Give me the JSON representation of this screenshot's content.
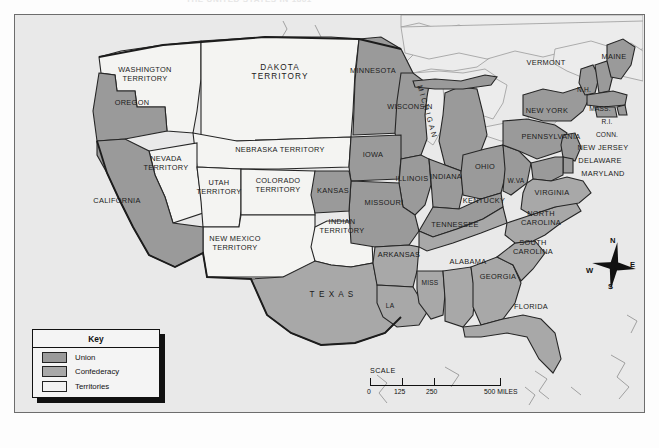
{
  "document": {
    "cut_off_heading": "THE UNITED STATES IN 1861",
    "map_title": "The United States During the Civil War"
  },
  "legend": {
    "title": "Key",
    "items": [
      {
        "label": "Union",
        "color": "#9a9a9a"
      },
      {
        "label": "Confederacy",
        "color": "#a8a8a8"
      },
      {
        "label": "Territories",
        "color": "#f2f2f2"
      }
    ]
  },
  "scale": {
    "title": "SCALE",
    "ticks": [
      "0",
      "125",
      "250",
      "500 MILES"
    ]
  },
  "compass": {
    "north": "N",
    "east": "E",
    "south": "S",
    "west": "W"
  },
  "colors": {
    "union": "#9a9a9a",
    "confederacy": "#a8a8a8",
    "territory": "#f4f4f2",
    "water": "#ececec",
    "background": "#e9e9e9",
    "border": "#6d6d6d",
    "outline": "#262626"
  },
  "regions": {
    "union_states": [
      "CALIFORNIA",
      "OREGON",
      "MINNESOTA",
      "WISCONSIN",
      "MICHIGAN",
      "IOWA",
      "ILLINOIS",
      "INDIANA",
      "OHIO",
      "MISSOURI",
      "KANSAS",
      "KENTUCKY",
      "W.VA",
      "PENNSYLVANIA",
      "NEW YORK",
      "VERMONT",
      "MAINE",
      "N.H.",
      "MASS.",
      "R.I.",
      "CONN.",
      "NEW JERSEY",
      "DELAWARE",
      "MARYLAND"
    ],
    "confederate_states": [
      "VIRGINIA",
      "NORTH CAROLINA",
      "SOUTH CAROLINA",
      "GEORGIA",
      "FLORIDA",
      "ALABAMA",
      "MISS.",
      "LA.",
      "ARKANSAS",
      "TENNESSEE",
      "TEXAS"
    ],
    "territories": [
      "WASHINGTON TERRITORY",
      "DAKOTA TERRITORY",
      "NEBRASKA TERRITORY",
      "NEVADA TERRITORY",
      "UTAH TERRITORY",
      "COLORADO TERRITORY",
      "NEW MEXICO TERRITORY",
      "INDIAN TERRITORY"
    ]
  },
  "labels": {
    "washington_territory_l1": "WASHINGTON",
    "washington_territory_l2": "TERRITORY",
    "oregon": "OREGON",
    "dakota_l1": "DAKOTA",
    "dakota_l2": "TERRITORY",
    "minnesota": "MINNESOTA",
    "wisconsin": "WISCONSIN",
    "michigan": "MICHIGAN",
    "nebraska_territory": "NEBRASKA TERRITORY",
    "iowa": "IOWA",
    "illinois": "ILLINOIS",
    "indiana": "INDIANA",
    "ohio": "OHIO",
    "nevada_l1": "NEVADA",
    "nevada_l2": "TERRITORY",
    "utah_l1": "UTAH",
    "utah_l2": "TERRITORY",
    "colorado_l1": "COLORADO",
    "colorado_l2": "TERRITORY",
    "kansas": "KANSAS",
    "california": "CALIFORNIA",
    "new_mexico_l1": "NEW MEXICO",
    "new_mexico_l2": "TERRITORY",
    "indian_l1": "INDIAN",
    "indian_l2": "TERRITORY",
    "missouri": "MISSOURI",
    "kentucky": "KENTUCKY",
    "wva": "W.VA",
    "virginia": "VIRGINIA",
    "north_carolina_l1": "NORTH",
    "north_carolina_l2": "CAROLINA",
    "south_carolina_l1": "SOUTH",
    "south_carolina_l2": "CAROLINA",
    "tennessee": "TENNESSEE",
    "arkansas": "ARKANSAS",
    "alabama": "ALABAMA",
    "georgia": "GEORGIA",
    "florida": "FLORIDA",
    "mississippi": "MISS",
    "louisiana": "LA",
    "texas": "T E X A S",
    "vermont": "VERMONT",
    "maine": "MAINE",
    "new_hampshire": "N.H.",
    "massachusetts": "MASS.",
    "rhode_island": "R.I.",
    "connecticut": "CONN.",
    "new_york": "NEW YORK",
    "pennsylvania": "PENNSYLVANIA",
    "new_jersey": "NEW JERSEY",
    "delaware": "DELAWARE",
    "maryland": "MARYLAND"
  }
}
